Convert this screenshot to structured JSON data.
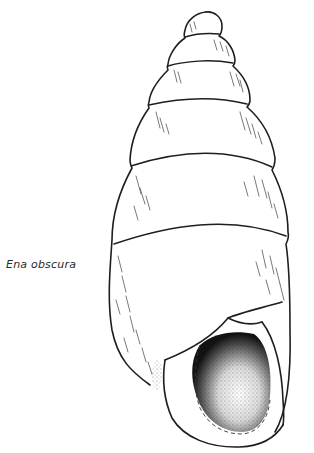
{
  "figure": {
    "species_label": "Ena obscura",
    "colors": {
      "ink": "#1e1e1e",
      "background": "#ffffff"
    }
  }
}
